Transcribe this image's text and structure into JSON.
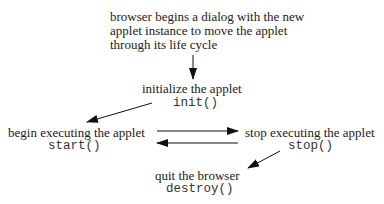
{
  "intro": {
    "lines": [
      "browser begins a dialog with the new",
      "applet instance to move the applet",
      "through its life cycle"
    ]
  },
  "nodes": {
    "init": {
      "label": "initialize the applet",
      "method": "init()"
    },
    "start": {
      "label": "begin executing the applet",
      "method": "start()"
    },
    "stop": {
      "label": "stop executing the applet",
      "method": "stop()"
    },
    "destroy": {
      "label": "quit the browser",
      "method": "destroy()"
    }
  },
  "edges": [
    {
      "from": "intro",
      "to": "init"
    },
    {
      "from": "init",
      "to": "start"
    },
    {
      "from": "start",
      "to": "stop"
    },
    {
      "from": "stop",
      "to": "start"
    },
    {
      "from": "stop",
      "to": "destroy"
    }
  ],
  "colors": {
    "text": "#1a1a1a",
    "arrow": "#111111",
    "background": "#ffffff"
  }
}
